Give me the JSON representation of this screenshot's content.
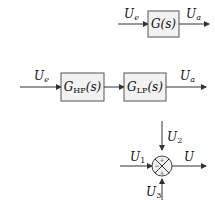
{
  "diagram": {
    "block1": {
      "input_label": "U",
      "input_sub": "e",
      "block_text": "G(s)",
      "output_label": "U",
      "output_sub": "a"
    },
    "block2": {
      "input_label": "U",
      "input_sub": "e",
      "block_hp_main": "G",
      "block_hp_sub": "HP",
      "block_hp_arg": "(s)",
      "block_lp_main": "G",
      "block_lp_sub": "LP",
      "block_lp_arg": "(s)",
      "output_label": "U",
      "output_sub": "a"
    },
    "summing_junction": {
      "input_left": "U",
      "input_left_sub": "1",
      "input_top": "U",
      "input_top_sub": "2",
      "input_bottom": "U",
      "input_bottom_sub": "3",
      "output": "U",
      "sign_top": "+",
      "sign_left": "−",
      "sign_bottom": "+"
    }
  }
}
